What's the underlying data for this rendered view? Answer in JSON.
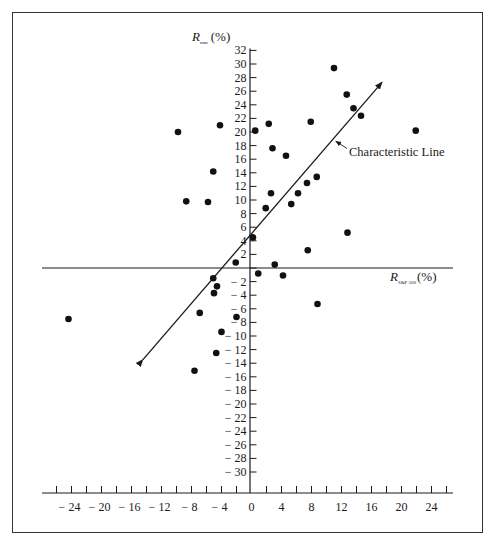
{
  "chart_data": {
    "type": "scatter",
    "title": "",
    "xlabel": "R",
    "xlabel_sub": "S&P 500",
    "xlabel_unit": "(%)",
    "ylabel": "R",
    "ylabel_sub": "mm",
    "ylabel_unit": "(%)",
    "xlim": [
      -26,
      26
    ],
    "ylim": [
      -32,
      32
    ],
    "grid": false,
    "legend": null,
    "x_ticks": [
      -24,
      -20,
      -16,
      -12,
      -8,
      -4,
      0,
      4,
      8,
      12,
      16,
      20,
      24
    ],
    "x_tick_labels": [
      "− 24",
      "− 20",
      "− 16",
      "− 12",
      "− 8",
      "− 4",
      "0",
      "4",
      "8",
      "12",
      "16",
      "20",
      "24"
    ],
    "x_minor_step": 2,
    "y_ticks": [
      32,
      30,
      28,
      26,
      24,
      22,
      20,
      18,
      16,
      14,
      12,
      10,
      8,
      6,
      4,
      2,
      0,
      -2,
      -4,
      -6,
      -8,
      -10,
      -12,
      -14,
      -16,
      -18,
      -20,
      -22,
      -24,
      -26,
      -28,
      -30
    ],
    "y_tick_labels": [
      "32",
      "30",
      "28",
      "26",
      "24",
      "22",
      "20",
      "18",
      "16",
      "14",
      "12",
      "10",
      "8",
      "6",
      "4",
      "2",
      "0",
      "− 2",
      "− 4",
      "− 6",
      "− 8",
      "− 10",
      "− 12",
      "− 14",
      "− 16",
      "− 18",
      "− 20",
      "− 22",
      "− 24",
      "− 26",
      "− 28",
      "− 30"
    ],
    "series": [
      {
        "name": "Observations",
        "points": [
          {
            "x": 11.0,
            "y": 29.4
          },
          {
            "x": 12.7,
            "y": 25.5
          },
          {
            "x": 13.6,
            "y": 23.5
          },
          {
            "x": 14.6,
            "y": 22.4
          },
          {
            "x": 7.9,
            "y": 21.5
          },
          {
            "x": 2.3,
            "y": 21.2
          },
          {
            "x": 0.5,
            "y": 20.2
          },
          {
            "x": 21.9,
            "y": 20.2
          },
          {
            "x": 2.8,
            "y": 17.6
          },
          {
            "x": 4.6,
            "y": 16.5
          },
          {
            "x": 8.7,
            "y": 13.4
          },
          {
            "x": 7.4,
            "y": 12.5
          },
          {
            "x": 2.6,
            "y": 11.0
          },
          {
            "x": 6.2,
            "y": 11.0
          },
          {
            "x": 5.3,
            "y": 9.4
          },
          {
            "x": 1.9,
            "y": 8.8
          },
          {
            "x": 12.8,
            "y": 5.2
          },
          {
            "x": 0.2,
            "y": 4.5
          },
          {
            "x": 7.5,
            "y": 2.6
          },
          {
            "x": 3.1,
            "y": 0.5
          },
          {
            "x": 0.9,
            "y": -0.8
          },
          {
            "x": 4.2,
            "y": -1.1
          },
          {
            "x": 8.8,
            "y": -5.3
          },
          {
            "x": -4.2,
            "y": 21.0
          },
          {
            "x": -9.8,
            "y": 20.0
          },
          {
            "x": -5.1,
            "y": 14.2
          },
          {
            "x": -8.7,
            "y": 9.8
          },
          {
            "x": -5.8,
            "y": 9.7
          },
          {
            "x": -2.1,
            "y": 0.8
          },
          {
            "x": -5.1,
            "y": -1.5
          },
          {
            "x": -4.6,
            "y": -2.7
          },
          {
            "x": -5.0,
            "y": -3.7
          },
          {
            "x": -6.9,
            "y": -6.6
          },
          {
            "x": -2.0,
            "y": -7.2
          },
          {
            "x": -4.0,
            "y": -9.4
          },
          {
            "x": -4.7,
            "y": -12.5
          },
          {
            "x": -7.6,
            "y": -15.1
          },
          {
            "x": -24.4,
            "y": -7.5
          }
        ]
      }
    ],
    "lines": [
      {
        "name": "Characteristic Line",
        "from": {
          "x": -14.5,
          "y": -13.5
        },
        "to": {
          "x": 17.4,
          "y": 27.3
        },
        "arrows": "both"
      }
    ],
    "annotations": [
      {
        "text": "Characteristic Line",
        "pointer_to": {
          "x": 11.1,
          "y": 18.8
        }
      }
    ]
  }
}
